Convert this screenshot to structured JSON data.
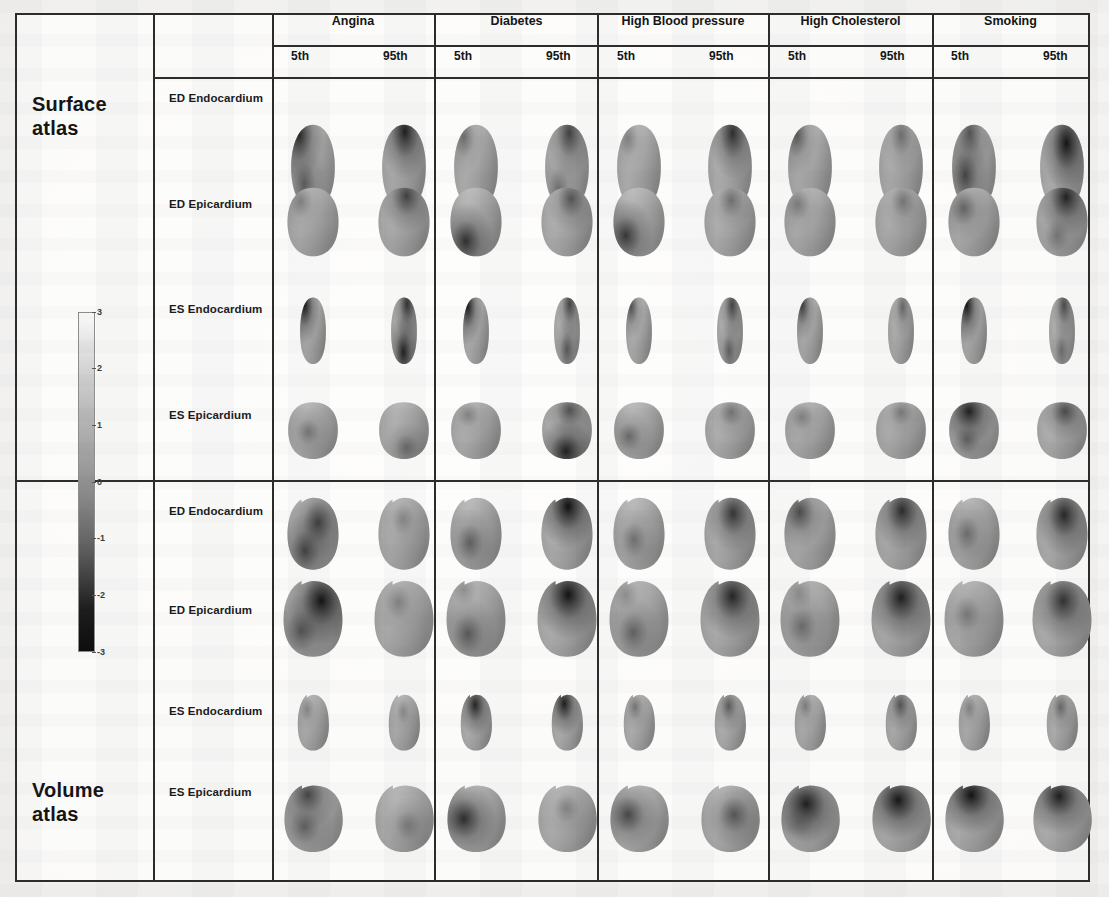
{
  "figure": {
    "kind": "cardiac-shape-atlas-grid",
    "atlases": [
      {
        "id": "surface",
        "label": "Surface\natlas"
      },
      {
        "id": "volume",
        "label": "Volume\natlas"
      }
    ],
    "row_labels": [
      "ED Endocardium",
      "ED Epicardium",
      "ES Endocardium",
      "ES Epicardium"
    ],
    "risk_factors": [
      "Angina",
      "Diabetes",
      "High Blood pressure",
      "High Cholesterol",
      "Smoking"
    ],
    "percentiles": [
      "5th",
      "95th"
    ],
    "colorbar": {
      "ticks": [
        "3",
        "2",
        "1",
        "0",
        "-1",
        "-2",
        "-3"
      ],
      "max": 3,
      "min": -3,
      "top_color": "#fafafa",
      "bottom_color": "#0d0d0d"
    }
  },
  "chart_data": {
    "type": "heatmap",
    "title": "",
    "xlabel": "",
    "ylabel": "",
    "columns": [
      "Angina 5th",
      "Angina 95th",
      "Diabetes 5th",
      "Diabetes 95th",
      "High Blood pressure 5th",
      "High Blood pressure 95th",
      "High Cholesterol 5th",
      "High Cholesterol 95th",
      "Smoking 5th",
      "Smoking 95th"
    ],
    "rows": [
      "Surface ED Endocardium",
      "Surface ED Epicardium",
      "Surface ES Endocardium",
      "Surface ES Epicardium",
      "Volume ED Endocardium",
      "Volume ED Epicardium",
      "Volume ES Endocardium",
      "Volume ES Epicardium"
    ],
    "colorbar_range": [
      -3,
      3
    ],
    "legend": "grayscale z-score colorbar, 3 (light) to -3 (dark)",
    "grid": true
  },
  "cells": [
    {
      "atlas": "surface",
      "row": 0,
      "col": 0,
      "pct": "5th",
      "shape": "bullet",
      "hot": [
        [
          18,
          12,
          0.86
        ],
        [
          30,
          70,
          0.55
        ]
      ]
    },
    {
      "atlas": "surface",
      "row": 0,
      "col": 1,
      "pct": "95th",
      "shape": "bullet",
      "hot": [
        [
          52,
          8,
          0.9
        ]
      ]
    },
    {
      "atlas": "surface",
      "row": 0,
      "col": 2,
      "pct": "5th",
      "shape": "bullet",
      "hot": [
        [
          22,
          14,
          0.45
        ]
      ]
    },
    {
      "atlas": "surface",
      "row": 0,
      "col": 3,
      "pct": "95th",
      "shape": "bullet",
      "hot": [
        [
          55,
          10,
          0.72
        ],
        [
          30,
          76,
          0.4
        ]
      ]
    },
    {
      "atlas": "surface",
      "row": 0,
      "col": 4,
      "pct": "5th",
      "shape": "bullet",
      "hot": [
        [
          25,
          16,
          0.3
        ]
      ]
    },
    {
      "atlas": "surface",
      "row": 0,
      "col": 5,
      "pct": "95th",
      "shape": "bullet",
      "hot": [
        [
          56,
          10,
          0.82
        ]
      ]
    },
    {
      "atlas": "surface",
      "row": 0,
      "col": 6,
      "pct": "5th",
      "shape": "bullet",
      "hot": [
        [
          20,
          12,
          0.58
        ]
      ]
    },
    {
      "atlas": "surface",
      "row": 0,
      "col": 7,
      "pct": "95th",
      "shape": "bullet",
      "hot": [
        [
          50,
          12,
          0.44
        ]
      ]
    },
    {
      "atlas": "surface",
      "row": 0,
      "col": 8,
      "pct": "5th",
      "shape": "bullet",
      "hot": [
        [
          40,
          10,
          0.62
        ],
        [
          30,
          60,
          0.7
        ]
      ]
    },
    {
      "atlas": "surface",
      "row": 0,
      "col": 9,
      "pct": "95th",
      "shape": "bullet",
      "hot": [
        [
          60,
          22,
          0.95
        ]
      ]
    },
    {
      "atlas": "surface",
      "row": 1,
      "col": 0,
      "pct": "5th",
      "shape": "dome",
      "hot": [
        [
          26,
          20,
          0.3
        ]
      ]
    },
    {
      "atlas": "surface",
      "row": 1,
      "col": 1,
      "pct": "95th",
      "shape": "dome",
      "hot": [
        [
          55,
          12,
          0.72
        ]
      ]
    },
    {
      "atlas": "surface",
      "row": 1,
      "col": 2,
      "pct": "5th",
      "shape": "dome",
      "hot": [
        [
          30,
          78,
          0.8
        ]
      ]
    },
    {
      "atlas": "surface",
      "row": 1,
      "col": 3,
      "pct": "95th",
      "shape": "dome",
      "hot": [
        [
          58,
          16,
          0.6
        ]
      ]
    },
    {
      "atlas": "surface",
      "row": 1,
      "col": 4,
      "pct": "5th",
      "shape": "dome",
      "hot": [
        [
          24,
          70,
          0.76
        ]
      ]
    },
    {
      "atlas": "surface",
      "row": 1,
      "col": 5,
      "pct": "95th",
      "shape": "dome",
      "hot": [
        [
          52,
          18,
          0.42
        ]
      ]
    },
    {
      "atlas": "surface",
      "row": 1,
      "col": 6,
      "pct": "5th",
      "shape": "dome",
      "hot": [
        [
          26,
          24,
          0.34
        ]
      ]
    },
    {
      "atlas": "surface",
      "row": 1,
      "col": 7,
      "pct": "95th",
      "shape": "dome",
      "hot": [
        [
          54,
          20,
          0.36
        ]
      ]
    },
    {
      "atlas": "surface",
      "row": 1,
      "col": 8,
      "pct": "5th",
      "shape": "dome",
      "hot": [
        [
          30,
          30,
          0.5
        ]
      ]
    },
    {
      "atlas": "surface",
      "row": 1,
      "col": 9,
      "pct": "95th",
      "shape": "dome",
      "hot": [
        [
          58,
          14,
          0.88
        ],
        [
          40,
          70,
          0.35
        ]
      ]
    },
    {
      "atlas": "surface",
      "row": 2,
      "col": 0,
      "pct": "5th",
      "shape": "narrow",
      "hot": [
        [
          18,
          12,
          0.92
        ]
      ]
    },
    {
      "atlas": "surface",
      "row": 2,
      "col": 1,
      "pct": "95th",
      "shape": "narrow",
      "hot": [
        [
          62,
          10,
          0.8
        ],
        [
          48,
          82,
          0.88
        ]
      ]
    },
    {
      "atlas": "surface",
      "row": 2,
      "col": 2,
      "pct": "5th",
      "shape": "narrow",
      "hot": [
        [
          18,
          14,
          0.9
        ]
      ]
    },
    {
      "atlas": "surface",
      "row": 2,
      "col": 3,
      "pct": "95th",
      "shape": "narrow",
      "hot": [
        [
          60,
          10,
          0.7
        ],
        [
          50,
          78,
          0.55
        ]
      ]
    },
    {
      "atlas": "surface",
      "row": 2,
      "col": 4,
      "pct": "5th",
      "shape": "narrow",
      "hot": [
        [
          20,
          14,
          0.62
        ]
      ]
    },
    {
      "atlas": "surface",
      "row": 2,
      "col": 5,
      "pct": "95th",
      "shape": "narrow",
      "hot": [
        [
          58,
          12,
          0.7
        ],
        [
          46,
          80,
          0.5
        ]
      ]
    },
    {
      "atlas": "surface",
      "row": 2,
      "col": 6,
      "pct": "5th",
      "shape": "narrow",
      "hot": [
        [
          20,
          12,
          0.74
        ]
      ]
    },
    {
      "atlas": "surface",
      "row": 2,
      "col": 7,
      "pct": "95th",
      "shape": "narrow",
      "hot": [
        [
          56,
          14,
          0.48
        ]
      ]
    },
    {
      "atlas": "surface",
      "row": 2,
      "col": 8,
      "pct": "5th",
      "shape": "narrow",
      "hot": [
        [
          22,
          12,
          0.94
        ]
      ]
    },
    {
      "atlas": "surface",
      "row": 2,
      "col": 9,
      "pct": "95th",
      "shape": "narrow",
      "hot": [
        [
          58,
          12,
          0.66
        ],
        [
          48,
          80,
          0.4
        ]
      ]
    },
    {
      "atlas": "surface",
      "row": 3,
      "col": 0,
      "pct": "5th",
      "shape": "wide",
      "hot": [
        [
          40,
          52,
          0.36
        ]
      ]
    },
    {
      "atlas": "surface",
      "row": 3,
      "col": 1,
      "pct": "95th",
      "shape": "wide",
      "hot": [
        [
          55,
          80,
          0.42
        ]
      ]
    },
    {
      "atlas": "surface",
      "row": 3,
      "col": 2,
      "pct": "5th",
      "shape": "wide",
      "hot": [
        [
          34,
          22,
          0.28
        ]
      ]
    },
    {
      "atlas": "surface",
      "row": 3,
      "col": 3,
      "pct": "95th",
      "shape": "wide",
      "hot": [
        [
          55,
          14,
          0.62
        ],
        [
          48,
          86,
          0.88
        ]
      ]
    },
    {
      "atlas": "surface",
      "row": 3,
      "col": 4,
      "pct": "5th",
      "shape": "wide",
      "hot": [
        [
          30,
          60,
          0.46
        ]
      ]
    },
    {
      "atlas": "surface",
      "row": 3,
      "col": 5,
      "pct": "95th",
      "shape": "wide",
      "hot": [
        [
          52,
          18,
          0.4
        ]
      ]
    },
    {
      "atlas": "surface",
      "row": 3,
      "col": 6,
      "pct": "5th",
      "shape": "wide",
      "hot": [
        [
          34,
          26,
          0.3
        ]
      ]
    },
    {
      "atlas": "surface",
      "row": 3,
      "col": 7,
      "pct": "95th",
      "shape": "wide",
      "hot": [
        [
          50,
          18,
          0.34
        ]
      ]
    },
    {
      "atlas": "surface",
      "row": 3,
      "col": 8,
      "pct": "5th",
      "shape": "wide",
      "hot": [
        [
          40,
          16,
          0.9
        ],
        [
          36,
          66,
          0.5
        ]
      ]
    },
    {
      "atlas": "surface",
      "row": 3,
      "col": 9,
      "pct": "95th",
      "shape": "wide",
      "hot": [
        [
          56,
          16,
          0.66
        ]
      ]
    },
    {
      "atlas": "volume",
      "row": 0,
      "col": 0,
      "pct": "5th",
      "shape": "notch",
      "hot": [
        [
          60,
          34,
          0.72
        ],
        [
          34,
          74,
          0.7
        ]
      ]
    },
    {
      "atlas": "volume",
      "row": 0,
      "col": 1,
      "pct": "95th",
      "shape": "notch",
      "hot": [
        [
          48,
          30,
          0.22
        ]
      ]
    },
    {
      "atlas": "volume",
      "row": 0,
      "col": 2,
      "pct": "5th",
      "shape": "notch",
      "hot": [
        [
          38,
          62,
          0.52
        ]
      ]
    },
    {
      "atlas": "volume",
      "row": 0,
      "col": 3,
      "pct": "95th",
      "shape": "notch",
      "hot": [
        [
          52,
          12,
          0.96
        ]
      ]
    },
    {
      "atlas": "volume",
      "row": 0,
      "col": 4,
      "pct": "5th",
      "shape": "notch",
      "hot": [
        [
          40,
          58,
          0.4
        ]
      ]
    },
    {
      "atlas": "volume",
      "row": 0,
      "col": 5,
      "pct": "95th",
      "shape": "notch",
      "hot": [
        [
          56,
          22,
          0.78
        ]
      ]
    },
    {
      "atlas": "volume",
      "row": 0,
      "col": 6,
      "pct": "5th",
      "shape": "notch",
      "hot": [
        [
          30,
          20,
          0.66
        ]
      ]
    },
    {
      "atlas": "volume",
      "row": 0,
      "col": 7,
      "pct": "95th",
      "shape": "notch",
      "hot": [
        [
          52,
          18,
          0.84
        ]
      ]
    },
    {
      "atlas": "volume",
      "row": 0,
      "col": 8,
      "pct": "5th",
      "shape": "notch",
      "hot": [
        [
          36,
          50,
          0.44
        ]
      ]
    },
    {
      "atlas": "volume",
      "row": 0,
      "col": 9,
      "pct": "95th",
      "shape": "notch",
      "hot": [
        [
          54,
          24,
          0.86
        ]
      ]
    },
    {
      "atlas": "volume",
      "row": 1,
      "col": 0,
      "pct": "5th",
      "shape": "bignotch",
      "hot": [
        [
          64,
          26,
          0.95
        ],
        [
          30,
          66,
          0.6
        ]
      ]
    },
    {
      "atlas": "volume",
      "row": 1,
      "col": 1,
      "pct": "95th",
      "shape": "bignotch",
      "hot": [
        [
          40,
          28,
          0.28
        ]
      ]
    },
    {
      "atlas": "volume",
      "row": 1,
      "col": 2,
      "pct": "5th",
      "shape": "bignotch",
      "hot": [
        [
          30,
          12,
          0.18
        ],
        [
          36,
          70,
          0.56
        ]
      ]
    },
    {
      "atlas": "volume",
      "row": 1,
      "col": 3,
      "pct": "95th",
      "shape": "bignotch",
      "hot": [
        [
          52,
          18,
          0.95
        ]
      ]
    },
    {
      "atlas": "volume",
      "row": 1,
      "col": 4,
      "pct": "5th",
      "shape": "bignotch",
      "hot": [
        [
          28,
          18,
          0.2
        ],
        [
          40,
          68,
          0.5
        ]
      ]
    },
    {
      "atlas": "volume",
      "row": 1,
      "col": 5,
      "pct": "95th",
      "shape": "bignotch",
      "hot": [
        [
          54,
          20,
          0.86
        ]
      ]
    },
    {
      "atlas": "volume",
      "row": 1,
      "col": 6,
      "pct": "5th",
      "shape": "bignotch",
      "hot": [
        [
          32,
          16,
          0.22
        ],
        [
          36,
          60,
          0.44
        ]
      ]
    },
    {
      "atlas": "volume",
      "row": 1,
      "col": 7,
      "pct": "95th",
      "shape": "bignotch",
      "hot": [
        [
          50,
          22,
          0.9
        ]
      ]
    },
    {
      "atlas": "volume",
      "row": 1,
      "col": 8,
      "pct": "5th",
      "shape": "bignotch",
      "hot": [
        [
          38,
          44,
          0.34
        ]
      ]
    },
    {
      "atlas": "volume",
      "row": 1,
      "col": 9,
      "pct": "95th",
      "shape": "bignotch",
      "hot": [
        [
          52,
          26,
          0.8
        ]
      ]
    },
    {
      "atlas": "volume",
      "row": 2,
      "col": 0,
      "pct": "5th",
      "shape": "smallnotch",
      "hot": [
        [
          30,
          26,
          0.26
        ]
      ]
    },
    {
      "atlas": "volume",
      "row": 2,
      "col": 1,
      "pct": "95th",
      "shape": "smallnotch",
      "hot": [
        [
          46,
          30,
          0.22
        ]
      ]
    },
    {
      "atlas": "volume",
      "row": 2,
      "col": 2,
      "pct": "5th",
      "shape": "smallnotch",
      "hot": [
        [
          46,
          18,
          0.86
        ]
      ]
    },
    {
      "atlas": "volume",
      "row": 2,
      "col": 3,
      "pct": "95th",
      "shape": "smallnotch",
      "hot": [
        [
          40,
          16,
          0.9
        ]
      ]
    },
    {
      "atlas": "volume",
      "row": 2,
      "col": 4,
      "pct": "5th",
      "shape": "smallnotch",
      "hot": [
        [
          36,
          22,
          0.4
        ]
      ]
    },
    {
      "atlas": "volume",
      "row": 2,
      "col": 5,
      "pct": "95th",
      "shape": "smallnotch",
      "hot": [
        [
          44,
          20,
          0.56
        ]
      ]
    },
    {
      "atlas": "volume",
      "row": 2,
      "col": 6,
      "pct": "5th",
      "shape": "smallnotch",
      "hot": [
        [
          34,
          20,
          0.34
        ]
      ]
    },
    {
      "atlas": "volume",
      "row": 2,
      "col": 7,
      "pct": "95th",
      "shape": "smallnotch",
      "hot": [
        [
          46,
          18,
          0.62
        ]
      ]
    },
    {
      "atlas": "volume",
      "row": 2,
      "col": 8,
      "pct": "5th",
      "shape": "smallnotch",
      "hot": [
        [
          34,
          24,
          0.3
        ]
      ]
    },
    {
      "atlas": "volume",
      "row": 2,
      "col": 9,
      "pct": "95th",
      "shape": "smallnotch",
      "hot": [
        [
          44,
          22,
          0.48
        ]
      ]
    },
    {
      "atlas": "volume",
      "row": 3,
      "col": 0,
      "pct": "5th",
      "shape": "notchwide",
      "hot": [
        [
          40,
          14,
          0.7
        ],
        [
          34,
          62,
          0.52
        ]
      ]
    },
    {
      "atlas": "volume",
      "row": 3,
      "col": 1,
      "pct": "95th",
      "shape": "notchwide",
      "hot": [
        [
          56,
          60,
          0.3
        ]
      ]
    },
    {
      "atlas": "volume",
      "row": 3,
      "col": 2,
      "pct": "5th",
      "shape": "notchwide",
      "hot": [
        [
          28,
          50,
          0.82
        ]
      ]
    },
    {
      "atlas": "volume",
      "row": 3,
      "col": 3,
      "pct": "95th",
      "shape": "notchwide",
      "hot": [
        [
          48,
          34,
          0.26
        ]
      ]
    },
    {
      "atlas": "volume",
      "row": 3,
      "col": 4,
      "pct": "5th",
      "shape": "notchwide",
      "hot": [
        [
          30,
          44,
          0.68
        ]
      ]
    },
    {
      "atlas": "volume",
      "row": 3,
      "col": 5,
      "pct": "95th",
      "shape": "notchwide",
      "hot": [
        [
          56,
          44,
          0.58
        ]
      ]
    },
    {
      "atlas": "volume",
      "row": 3,
      "col": 6,
      "pct": "5th",
      "shape": "notchwide",
      "hot": [
        [
          42,
          28,
          0.92
        ],
        [
          30,
          54,
          0.4
        ]
      ]
    },
    {
      "atlas": "volume",
      "row": 3,
      "col": 7,
      "pct": "95th",
      "shape": "notchwide",
      "hot": [
        [
          44,
          22,
          0.94
        ]
      ]
    },
    {
      "atlas": "volume",
      "row": 3,
      "col": 8,
      "pct": "5th",
      "shape": "notchwide",
      "hot": [
        [
          44,
          14,
          0.96
        ]
      ]
    },
    {
      "atlas": "volume",
      "row": 3,
      "col": 9,
      "pct": "95th",
      "shape": "notchwide",
      "hot": [
        [
          44,
          16,
          0.9
        ]
      ]
    }
  ]
}
